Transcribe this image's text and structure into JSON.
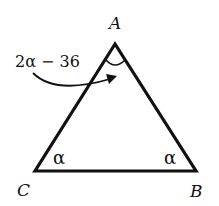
{
  "diagram": {
    "type": "isosceles triangle",
    "vertices": {
      "A": {
        "label": "A"
      },
      "B": {
        "label": "B"
      },
      "C": {
        "label": "C"
      }
    },
    "angles": {
      "A": "2α − 36",
      "B": "α",
      "C": "α"
    },
    "colors": {
      "stroke": "#111111",
      "background": "#ffffff"
    }
  }
}
